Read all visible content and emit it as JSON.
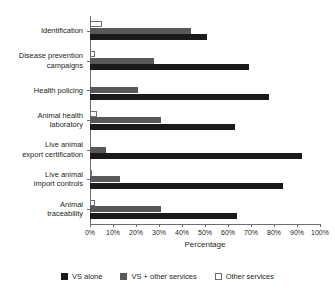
{
  "chart_data": {
    "type": "bar",
    "orientation": "horizontal",
    "title": "",
    "xlabel": "Percentage",
    "ylabel": "",
    "xlim": [
      0,
      100
    ],
    "grid": false,
    "legend_position": "bottom",
    "xticks": [
      "0%",
      "10%",
      "20%",
      "30%",
      "40%",
      "50%",
      "60%",
      "70%",
      "80%",
      "90%",
      "100%"
    ],
    "xtick_values": [
      0,
      10,
      20,
      30,
      40,
      50,
      60,
      70,
      80,
      90,
      100
    ],
    "categories": [
      "Identification",
      "Disease prevention\ncampaigns",
      "Health policing",
      "Animal health\nlaboratory",
      "Live animal\nexport certification",
      "Live animal\nimport controls",
      "Animal\ntraceability"
    ],
    "series": [
      {
        "name": "VS alone",
        "color": "#1a1a1a",
        "values": [
          51,
          69,
          78,
          63,
          92,
          84,
          64
        ]
      },
      {
        "name": "VS + other services",
        "color": "#58585b",
        "values": [
          44,
          28,
          21,
          31,
          7,
          13,
          31
        ]
      },
      {
        "name": "Other services",
        "color": "#ffffff",
        "values": [
          5,
          2,
          0,
          3,
          0,
          1,
          2
        ]
      }
    ]
  },
  "axis": {
    "x_title": "Percentage"
  },
  "legend": {
    "items": [
      {
        "label": "VS alone",
        "swatch": "black"
      },
      {
        "label": "VS + other services",
        "swatch": "gray"
      },
      {
        "label": "Other services",
        "swatch": "white"
      }
    ]
  },
  "colors": {
    "vs_alone": "#1a1a1a",
    "vs_other_services": "#58585b",
    "other_services": "#ffffff",
    "axis": "#6d6e71",
    "text": "#231f20",
    "background": "#ffffff"
  }
}
